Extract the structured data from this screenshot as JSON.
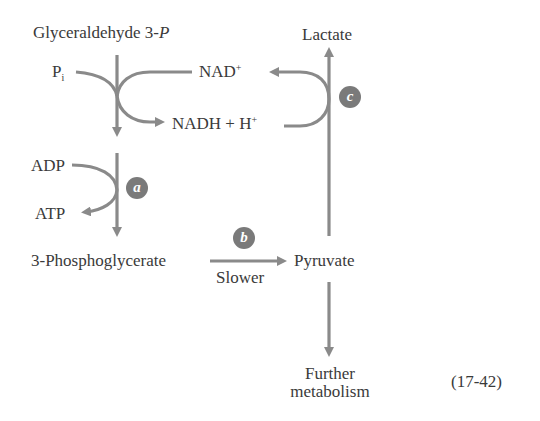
{
  "figure": {
    "equation_number": "(17-42)",
    "colors": {
      "arrow": "#8a8a8a",
      "badge": "#7a7a7a",
      "text": "#3a3a3a",
      "background": "#ffffff"
    }
  },
  "nodes": {
    "glyceraldehyde": {
      "text": "Glyceraldehyde 3-",
      "italic_suffix": "P"
    },
    "pi": {
      "base": "P",
      "sub": "i"
    },
    "nad_plus": {
      "base": "NAD",
      "sup": "+"
    },
    "nadh": {
      "base": "NADH + H",
      "sup": "+"
    },
    "adp": "ADP",
    "atp": "ATP",
    "phosphoglycerate": "3-Phosphoglycerate",
    "slower": "Slower",
    "pyruvate": "Pyruvate",
    "lactate": "Lactate",
    "further_1": "Further",
    "further_2": "metabolism"
  },
  "badges": {
    "a": "a",
    "b": "b",
    "c": "c"
  },
  "edges": [
    {
      "from": "Glyceraldehyde 3-P",
      "to": "3-Phosphoglycerate",
      "cofactors": [
        "Pi",
        "NAD+ -> NADH + H+",
        "ADP -> ATP"
      ],
      "step": "a"
    },
    {
      "from": "3-Phosphoglycerate",
      "to": "Pyruvate",
      "label": "Slower",
      "step": "b"
    },
    {
      "from": "Pyruvate",
      "to": "Lactate",
      "cofactors": [
        "NADH + H+ -> NAD+"
      ],
      "step": "c"
    },
    {
      "from": "Pyruvate",
      "to": "Further metabolism"
    }
  ]
}
